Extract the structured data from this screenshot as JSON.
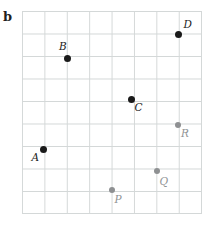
{
  "figure": {
    "part_label": "b"
  },
  "colors": {
    "background": "#ffffff",
    "grid_line": "#d4d8d8",
    "black_point": "#1a1a1a",
    "black_label": "#1c1c1c",
    "gray_point": "#8e9092",
    "gray_label": "#909395"
  },
  "grid": {
    "left": 21.5,
    "top": 10.5,
    "cols": 8,
    "rows": 9,
    "cell_width": 22.4,
    "cell_height": 22.5
  },
  "points": [
    {
      "label": "A",
      "color": "black",
      "x": 43,
      "y": 149,
      "label_x": 31.5,
      "label_y": 152
    },
    {
      "label": "B",
      "color": "black",
      "x": 67.3,
      "y": 58.3,
      "label_x": 59,
      "label_y": 41
    },
    {
      "label": "C",
      "color": "black",
      "x": 131.7,
      "y": 99,
      "label_x": 134.5,
      "label_y": 102
    },
    {
      "label": "D",
      "color": "black",
      "x": 178.3,
      "y": 34.3,
      "label_x": 183.5,
      "label_y": 19
    },
    {
      "label": "P",
      "color": "gray",
      "x": 111.7,
      "y": 190,
      "label_x": 114.5,
      "label_y": 194
    },
    {
      "label": "Q",
      "color": "gray",
      "x": 157,
      "y": 171,
      "label_x": 159.5,
      "label_y": 175.5
    },
    {
      "label": "R",
      "color": "gray",
      "x": 178.3,
      "y": 125,
      "label_x": 181,
      "label_y": 128
    }
  ]
}
